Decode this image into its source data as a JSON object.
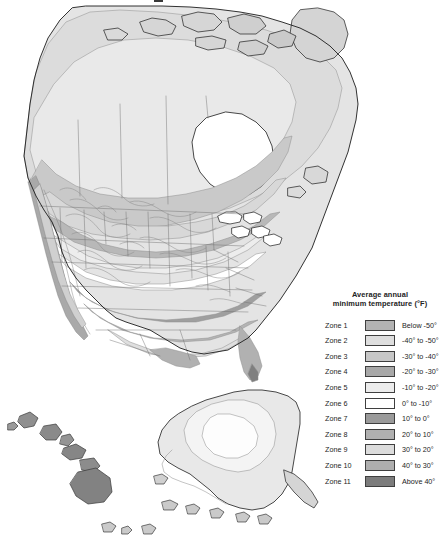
{
  "page": {
    "background_color": "#ffffff",
    "width": 437,
    "height": 550,
    "title_fragment": "."
  },
  "map": {
    "name": "north-america-plant-hardiness-zone-map",
    "description": "Grayscale map of North America showing average annual minimum temperature zones, with Alaska and Hawaii insets at the bottom.",
    "ocean_color": "#ffffff",
    "border_color": "#1c1c1c",
    "internal_border_color": "#6b6b6b",
    "insets": [
      {
        "name": "alaska-inset",
        "label": ""
      },
      {
        "name": "hawaii-inset",
        "label": ""
      }
    ]
  },
  "legend": {
    "title_line1": "Average annual",
    "title_line2": "minimum temperature (°F)",
    "rows": [
      {
        "zone": "Zone 1",
        "range": "Below -50°",
        "color": "#b3b3b3"
      },
      {
        "zone": "Zone 2",
        "range": "-40° to -50°",
        "color": "#dedede"
      },
      {
        "zone": "Zone 3",
        "range": "-30° to -40°",
        "color": "#c7c7c7"
      },
      {
        "zone": "Zone 4",
        "range": "-20° to -30°",
        "color": "#a8a8a8"
      },
      {
        "zone": "Zone 5",
        "range": "-10° to -20°",
        "color": "#ececec"
      },
      {
        "zone": "Zone 6",
        "range": "0° to -10°",
        "color": "#ffffff"
      },
      {
        "zone": "Zone 7",
        "range": "10° to 0°",
        "color": "#9a9a9a"
      },
      {
        "zone": "Zone 8",
        "range": "20° to 10°",
        "color": "#b0b0b0"
      },
      {
        "zone": "Zone 9",
        "range": "30° to 20°",
        "color": "#dcdcdc"
      },
      {
        "zone": "Zone 10",
        "range": "40° to 30°",
        "color": "#aeaeae"
      },
      {
        "zone": "Zone 11",
        "range": "Above 40°",
        "color": "#7c7c7c"
      }
    ]
  }
}
